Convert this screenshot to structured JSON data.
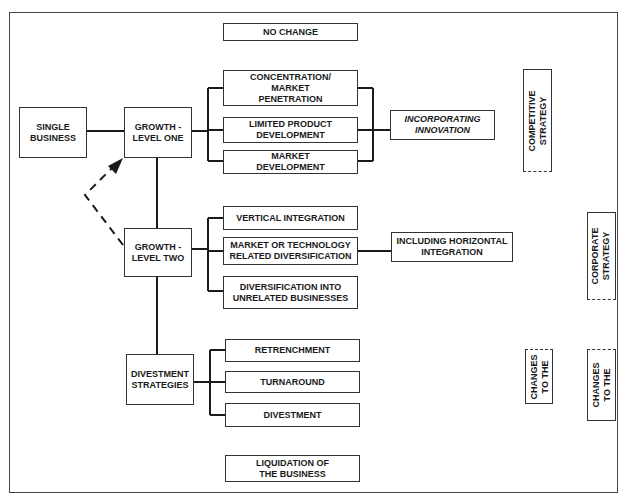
{
  "diagram": {
    "type": "strategy-flow",
    "nodes": {
      "no_change": "NO CHANGE",
      "single_business": "SINGLE\nBUSINESS",
      "growth_one": "GROWTH -\nLEVEL ONE",
      "concentration": "CONCENTRATION/\nMARKET\nPENETRATION",
      "limited_product": "LIMITED PRODUCT\nDEVELOPMENT",
      "market_development": "MARKET\nDEVELOPMENT",
      "incorporating_innovation": "INCORPORATING\nINNOVATION",
      "growth_two": "GROWTH -\nLEVEL TWO",
      "vertical_integration": "VERTICAL INTEGRATION",
      "related_diversification": "MARKET OR TECHNOLOGY\nRELATED DIVERSIFICATION",
      "unrelated_diversification": "DIVERSIFICATION INTO\nUNRELATED BUSINESSES",
      "horizontal_integration": "INCLUDING HORIZONTAL\nINTEGRATION",
      "divestment_strategies": "DIVESTMENT\nSTRATEGIES",
      "retrenchment": "RETRENCHMENT",
      "turnaround": "TURNAROUND",
      "divestment": "DIVESTMENT",
      "liquidation": "LIQUIDATION OF\nTHE BUSINESS"
    },
    "side_labels": {
      "competitive_strategy": "COMPETITIVE\nSTRATEGY",
      "corporate_strategy": "CORPORATE\nSTRATEGY",
      "changes_left": "CHANGES\nTO THE",
      "changes_right": "CHANGES\nTO THE"
    },
    "edges": [
      [
        "single_business",
        "growth_one"
      ],
      [
        "growth_one",
        "concentration"
      ],
      [
        "growth_one",
        "limited_product"
      ],
      [
        "growth_one",
        "market_development"
      ],
      [
        "concentration",
        "incorporating_innovation"
      ],
      [
        "limited_product",
        "incorporating_innovation"
      ],
      [
        "market_development",
        "incorporating_innovation"
      ],
      [
        "growth_one",
        "growth_two"
      ],
      [
        "growth_two",
        "vertical_integration"
      ],
      [
        "growth_two",
        "related_diversification"
      ],
      [
        "growth_two",
        "unrelated_diversification"
      ],
      [
        "related_diversification",
        "horizontal_integration"
      ],
      [
        "growth_two",
        "divestment_strategies"
      ],
      [
        "divestment_strategies",
        "retrenchment"
      ],
      [
        "divestment_strategies",
        "turnaround"
      ],
      [
        "divestment_strategies",
        "divestment"
      ]
    ],
    "dashed_edges": [
      [
        "growth_two",
        "growth_one",
        "arrow"
      ]
    ],
    "colors": {
      "line": "#1a1a1a",
      "background": "#ffffff"
    }
  }
}
